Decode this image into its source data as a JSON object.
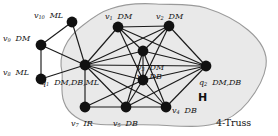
{
  "figure": {
    "region_label": "H",
    "truss_label": "4-Truss",
    "blob_fill": "#e9e9e9",
    "blob_stroke": "#9a9a9a",
    "node_color": "#111111",
    "edge_color": "#1a1a1a",
    "background": "#ffffff"
  },
  "nodes": [
    {
      "id": "v10",
      "name": "v",
      "sub": "10",
      "attrs": "ML",
      "x": 72,
      "y": 22,
      "label_x": 34,
      "label_y": 5,
      "in_truss": false
    },
    {
      "id": "v9",
      "name": "v",
      "sub": "9",
      "attrs": "DM",
      "x": 41,
      "y": 45,
      "label_x": 3,
      "label_y": 28,
      "in_truss": false
    },
    {
      "id": "v8",
      "name": "v",
      "sub": "8",
      "attrs": "ML",
      "x": 41,
      "y": 79,
      "label_x": 3,
      "label_y": 62,
      "in_truss": false
    },
    {
      "id": "q1",
      "name": "q",
      "sub": "1",
      "attrs": "DM,DB,ML",
      "x": 85,
      "y": 65,
      "label_x": 41,
      "label_y": 72,
      "in_truss": true
    },
    {
      "id": "v1",
      "name": "v",
      "sub": "1",
      "attrs": "DM",
      "x": 118,
      "y": 27,
      "label_x": 105,
      "label_y": 6,
      "in_truss": true
    },
    {
      "id": "v2",
      "name": "v",
      "sub": "2",
      "attrs": "DM",
      "x": 169,
      "y": 26,
      "label_x": 156,
      "label_y": 6,
      "in_truss": true
    },
    {
      "id": "v3",
      "name": "v",
      "sub": "3",
      "attrs": "DM",
      "x": 143,
      "y": 51,
      "label_x": 137,
      "label_y": 57,
      "in_truss": true
    },
    {
      "id": "v6",
      "name": "v",
      "sub": "6",
      "attrs": "DB",
      "x": 143,
      "y": 80,
      "label_x": 137,
      "label_y": 66,
      "in_truss": true
    },
    {
      "id": "q2",
      "name": "q",
      "sub": "2",
      "attrs": "DM,DB",
      "x": 206,
      "y": 66,
      "label_x": 199,
      "label_y": 72,
      "in_truss": true
    },
    {
      "id": "v7",
      "name": "v",
      "sub": "7",
      "attrs": "IR",
      "x": 85,
      "y": 107,
      "label_x": 71,
      "label_y": 113,
      "in_truss": true
    },
    {
      "id": "v5",
      "name": "v",
      "sub": "5",
      "attrs": "DB",
      "x": 126,
      "y": 107,
      "label_x": 113,
      "label_y": 113,
      "in_truss": true
    },
    {
      "id": "v4",
      "name": "v",
      "sub": "4",
      "attrs": "DB",
      "x": 166,
      "y": 107,
      "label_x": 172,
      "label_y": 100,
      "in_truss": true
    }
  ],
  "edges": [
    [
      "v10",
      "v9"
    ],
    [
      "v10",
      "q1"
    ],
    [
      "v9",
      "v8"
    ],
    [
      "v9",
      "q1"
    ],
    [
      "v8",
      "q1"
    ],
    [
      "q1",
      "v1"
    ],
    [
      "q1",
      "v2"
    ],
    [
      "q1",
      "v3"
    ],
    [
      "q1",
      "v6"
    ],
    [
      "q1",
      "q2"
    ],
    [
      "q1",
      "v7"
    ],
    [
      "q1",
      "v5"
    ],
    [
      "q1",
      "v4"
    ],
    [
      "v1",
      "v2"
    ],
    [
      "v1",
      "v3"
    ],
    [
      "v1",
      "v6"
    ],
    [
      "v1",
      "q2"
    ],
    [
      "v2",
      "v3"
    ],
    [
      "v2",
      "v6"
    ],
    [
      "v2",
      "q2"
    ],
    [
      "v3",
      "v6"
    ],
    [
      "v3",
      "q2"
    ],
    [
      "v3",
      "v5"
    ],
    [
      "v3",
      "v4"
    ],
    [
      "v6",
      "q2"
    ],
    [
      "v6",
      "v7"
    ],
    [
      "v6",
      "v5"
    ],
    [
      "v6",
      "v4"
    ],
    [
      "q2",
      "v4"
    ],
    [
      "q2",
      "v5"
    ],
    [
      "v7",
      "v5"
    ],
    [
      "v5",
      "v4"
    ]
  ],
  "region_marks": {
    "h_x": 198,
    "h_y": 92,
    "truss_x": 216,
    "truss_y": 118
  }
}
